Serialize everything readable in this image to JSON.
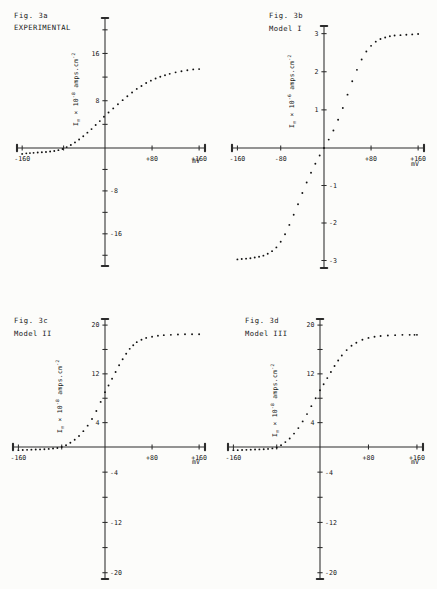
{
  "sheet": {
    "name": "Figure 3 — membrane current-voltage relations"
  },
  "common": {
    "xlabel": "mV",
    "y_prefix": "I",
    "y_sub": "m",
    "y_mid": " × 10",
    "y_unit": " amps.cm",
    "y_unit_sup": "-2"
  },
  "panels": [
    {
      "id": "3a",
      "fig_label": "Fig. 3a",
      "subtitle": "EXPERIMENTAL",
      "y_exp": "-8",
      "chart_data": {
        "type": "scatter",
        "title": "Fig. 3a EXPERIMENTAL",
        "xlabel": "mV",
        "ylabel": "I_m x 10^-8 amps.cm^-2",
        "xlim": [
          -170,
          170
        ],
        "ylim": [
          -22,
          22
        ],
        "xticks": [
          -160,
          -80,
          0,
          80,
          160
        ],
        "xticklabels": [
          "-160",
          "",
          "",
          "+80",
          "+160"
        ],
        "yticks": [
          -20,
          -16,
          -12,
          -8,
          -4,
          4,
          8,
          12,
          16,
          20
        ],
        "yticklabels": [
          "",
          "-16",
          "",
          "-8",
          "",
          "",
          "8",
          "",
          "16",
          ""
        ],
        "grid": false,
        "legend": null,
        "x": [
          -160,
          -152,
          -145,
          -138,
          -130,
          -122,
          -114,
          -106,
          -98,
          -90,
          -82,
          -74,
          -66,
          -58,
          -50,
          -42,
          -34,
          -26,
          -18,
          -10,
          -2,
          6,
          14,
          22,
          30,
          38,
          46,
          54,
          62,
          70,
          78,
          86,
          94,
          102,
          110,
          120,
          130,
          140,
          150,
          160
        ],
        "y": [
          -1.1,
          -1.0,
          -0.95,
          -0.9,
          -0.85,
          -0.8,
          -0.75,
          -0.65,
          -0.55,
          -0.4,
          -0.2,
          0.15,
          0.5,
          0.95,
          1.45,
          2.0,
          2.6,
          3.2,
          3.9,
          4.55,
          5.3,
          6.0,
          6.7,
          7.4,
          8.1,
          8.75,
          9.4,
          10.0,
          10.5,
          11.0,
          11.4,
          11.75,
          12.05,
          12.3,
          12.55,
          12.8,
          13.0,
          13.15,
          13.3,
          13.35
        ]
      }
    },
    {
      "id": "3b",
      "fig_label": "Fig. 3b",
      "subtitle": "Model I",
      "y_exp": "-6",
      "chart_data": {
        "type": "scatter",
        "title": "Fig. 3b Model I",
        "xlabel": "mV",
        "ylabel": "I_m x 10^-6 amps.cm^-2",
        "xlim": [
          -170,
          170
        ],
        "ylim": [
          -3.2,
          3.2
        ],
        "xticks": [
          -160,
          -80,
          0,
          80,
          160
        ],
        "xticklabels": [
          "-160",
          "-80",
          "",
          "+80",
          "+160"
        ],
        "yticks": [
          -3,
          -2,
          -1,
          1,
          2,
          3
        ],
        "yticklabels": [
          "-3",
          "-2",
          "-1",
          "1",
          "2",
          "3"
        ],
        "grid": false,
        "legend": null,
        "x": [
          -160,
          -152,
          -144,
          -136,
          -128,
          -120,
          -112,
          -104,
          -96,
          -88,
          -80,
          -72,
          -64,
          -56,
          -48,
          -40,
          -32,
          -24,
          -16,
          -8,
          0,
          8,
          16,
          24,
          32,
          40,
          48,
          56,
          64,
          72,
          80,
          88,
          96,
          104,
          112,
          120,
          130,
          140,
          150,
          160
        ],
        "y": [
          -2.97,
          -2.96,
          -2.95,
          -2.94,
          -2.92,
          -2.9,
          -2.87,
          -2.82,
          -2.75,
          -2.65,
          -2.5,
          -2.3,
          -2.05,
          -1.78,
          -1.5,
          -1.2,
          -0.92,
          -0.66,
          -0.42,
          -0.2,
          0.0,
          0.22,
          0.46,
          0.74,
          1.05,
          1.4,
          1.75,
          2.05,
          2.32,
          2.53,
          2.68,
          2.79,
          2.86,
          2.9,
          2.93,
          2.95,
          2.96,
          2.97,
          2.98,
          2.99
        ]
      }
    },
    {
      "id": "3c",
      "fig_label": "Fig. 3c",
      "subtitle": "Model II",
      "y_exp": "-8",
      "chart_data": {
        "type": "scatter",
        "title": "Fig. 3c Model II",
        "xlabel": "mV",
        "ylabel": "I_m x 10^-8 amps.cm^-2",
        "xlim": [
          -170,
          170
        ],
        "ylim": [
          -21,
          21
        ],
        "xticks": [
          -160,
          -80,
          0,
          80,
          160
        ],
        "xticklabels": [
          "-160",
          "",
          "",
          "+80",
          "+160"
        ],
        "yticks": [
          -20,
          -16,
          -12,
          -8,
          -4,
          4,
          8,
          12,
          16,
          20
        ],
        "yticklabels": [
          "-20",
          "",
          "-12",
          "",
          "-4",
          "4",
          "",
          "12",
          "",
          "20"
        ],
        "grid": false,
        "legend": null,
        "x": [
          -160,
          -152,
          -144,
          -136,
          -128,
          -120,
          -112,
          -104,
          -96,
          -88,
          -80,
          -72,
          -64,
          -56,
          -48,
          -40,
          -32,
          -24,
          -16,
          -8,
          0,
          6,
          12,
          18,
          24,
          30,
          36,
          42,
          48,
          54,
          62,
          70,
          80,
          90,
          100,
          112,
          124,
          136,
          148,
          160
        ],
        "y": [
          -0.5,
          -0.48,
          -0.45,
          -0.42,
          -0.4,
          -0.38,
          -0.35,
          -0.3,
          -0.25,
          -0.15,
          0.0,
          0.3,
          0.7,
          1.2,
          1.8,
          2.6,
          3.5,
          4.6,
          5.9,
          7.4,
          9.0,
          10.1,
          11.2,
          12.3,
          13.4,
          14.4,
          15.3,
          16.1,
          16.7,
          17.2,
          17.6,
          17.9,
          18.1,
          18.25,
          18.35,
          18.4,
          18.45,
          18.5,
          18.5,
          18.5
        ]
      }
    },
    {
      "id": "3d",
      "fig_label": "Fig. 3d",
      "subtitle": "Model III",
      "y_exp": "-8",
      "chart_data": {
        "type": "scatter",
        "title": "Fig. 3d Model III",
        "xlabel": "mV",
        "ylabel": "I_m x 10^-8 amps.cm^-2",
        "xlim": [
          -170,
          170
        ],
        "ylim": [
          -21,
          21
        ],
        "xticks": [
          -160,
          -80,
          0,
          80,
          160
        ],
        "xticklabels": [
          "-160",
          "",
          "",
          "+80",
          "+160"
        ],
        "yticks": [
          -20,
          -16,
          -12,
          -8,
          -4,
          4,
          8,
          12,
          16,
          20
        ],
        "yticklabels": [
          "-20",
          "",
          "-12",
          "",
          "-4",
          "4",
          "",
          "12",
          "",
          "20"
        ],
        "grid": false,
        "legend": null,
        "x": [
          -160,
          -152,
          -144,
          -136,
          -128,
          -120,
          -112,
          -104,
          -96,
          -88,
          -80,
          -72,
          -64,
          -56,
          -48,
          -40,
          -32,
          -24,
          -16,
          -8,
          0,
          6,
          12,
          18,
          24,
          30,
          36,
          44,
          52,
          60,
          70,
          80,
          90,
          100,
          112,
          124,
          136,
          148,
          156,
          160
        ],
        "y": [
          -0.5,
          -0.5,
          -0.48,
          -0.45,
          -0.42,
          -0.4,
          -0.38,
          -0.35,
          -0.3,
          -0.22,
          -0.1,
          0.3,
          0.8,
          1.4,
          2.2,
          3.1,
          4.2,
          5.4,
          6.7,
          8.0,
          9.3,
          10.3,
          11.3,
          12.3,
          13.3,
          14.2,
          15.0,
          15.9,
          16.6,
          17.1,
          17.6,
          17.9,
          18.1,
          18.2,
          18.3,
          18.35,
          18.4,
          18.4,
          18.4,
          18.4
        ]
      }
    }
  ]
}
